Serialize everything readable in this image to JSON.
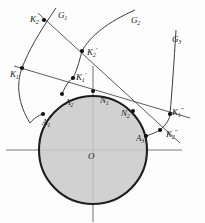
{
  "figure": {
    "background_color": "#fdfdfd",
    "stroke_color": "#2a2a2a",
    "disk_fill_color": "#c9c9c9",
    "thin_line_color": "#5a5a5a",
    "curve_color": "#444444"
  },
  "circle": {
    "label": "O",
    "center": {
      "x": 93,
      "y": 150
    },
    "radius": 54
  },
  "axes": {
    "horizontal": {
      "x1": 6,
      "y1": 150,
      "x2": 182,
      "y2": 150
    },
    "vertical": {
      "x1": 93,
      "y1": 66,
      "x2": 93,
      "y2": 222
    }
  },
  "curves": [
    {
      "name": "G1",
      "label": "G₁",
      "label_text": "G",
      "label_sub": "1"
    },
    {
      "name": "G2",
      "label": "G₂",
      "label_text": "G",
      "label_sub": "2"
    },
    {
      "name": "G3",
      "label": "G₃",
      "label_text": "G",
      "label_sub": "3"
    }
  ],
  "labels": [
    {
      "name": "label-K2",
      "base": "K",
      "sub": "2",
      "sup": "",
      "x": 30,
      "y": 15
    },
    {
      "name": "label-G1",
      "base": "G",
      "sub": "1",
      "sup": "",
      "x": 58,
      "y": 11
    },
    {
      "name": "label-G2",
      "base": "G",
      "sub": "2",
      "sup": "",
      "x": 131,
      "y": 16
    },
    {
      "name": "label-G3",
      "base": "G",
      "sub": "3",
      "sup": "",
      "x": 172,
      "y": 35
    },
    {
      "name": "label-K2prime",
      "base": "K",
      "sub": "2",
      "sup": "′",
      "x": 87,
      "y": 48
    },
    {
      "name": "label-K1",
      "base": "K",
      "sub": "1",
      "sup": "",
      "x": 10,
      "y": 70
    },
    {
      "name": "label-K1prime",
      "base": "K",
      "sub": "1",
      "sup": "′",
      "x": 76,
      "y": 73
    },
    {
      "name": "label-A2",
      "base": "A",
      "sub": "2",
      "sup": "",
      "x": 65,
      "y": 98
    },
    {
      "name": "label-N1",
      "base": "N",
      "sub": "1",
      "sup": "",
      "x": 100,
      "y": 96
    },
    {
      "name": "label-N2",
      "base": "N",
      "sub": "2",
      "sup": "",
      "x": 121,
      "y": 109
    },
    {
      "name": "label-A1",
      "base": "A",
      "sub": "1",
      "sup": "",
      "x": 42,
      "y": 118
    },
    {
      "name": "label-K1dprime",
      "base": "K",
      "sub": "1",
      "sup": "″",
      "x": 172,
      "y": 108
    },
    {
      "name": "label-K2dprime",
      "base": "K",
      "sub": "2",
      "sup": "″",
      "x": 166,
      "y": 130
    },
    {
      "name": "label-A3",
      "base": "A",
      "sub": "3",
      "sup": "",
      "x": 136,
      "y": 134
    },
    {
      "name": "label-O",
      "base": "O",
      "sub": "",
      "sup": "",
      "x": 88,
      "y": 152
    }
  ],
  "points": [
    {
      "name": "point-K2",
      "x": 44,
      "y": 20
    },
    {
      "name": "point-K2prime",
      "x": 82,
      "y": 51
    },
    {
      "name": "point-K1",
      "x": 22,
      "y": 68
    },
    {
      "name": "point-K1prime",
      "x": 73,
      "y": 78
    },
    {
      "name": "point-A2",
      "x": 62,
      "y": 94
    },
    {
      "name": "point-N1",
      "x": 93,
      "y": 91
    },
    {
      "name": "point-N2",
      "x": 133,
      "y": 111
    },
    {
      "name": "point-A1",
      "x": 43,
      "y": 114
    },
    {
      "name": "point-K1dprime",
      "x": 170,
      "y": 114
    },
    {
      "name": "point-K2dprime",
      "x": 160,
      "y": 130
    },
    {
      "name": "point-A3",
      "x": 146,
      "y": 136
    }
  ]
}
